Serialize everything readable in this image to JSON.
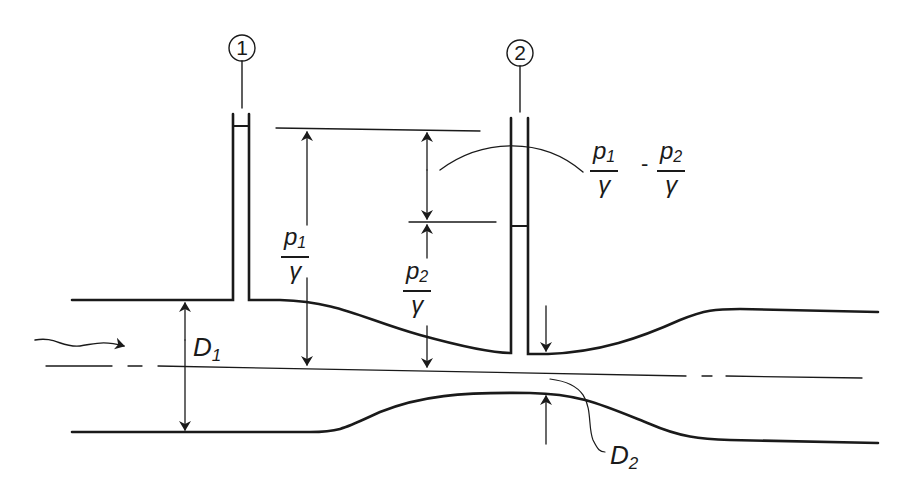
{
  "diagram": {
    "type": "venturi-meter",
    "colors": {
      "line": "#1a1a1a",
      "background": "#ffffff"
    },
    "stations": [
      {
        "label": "1"
      },
      {
        "label": "2"
      }
    ],
    "labels": {
      "p1_head": {
        "num": "p",
        "num_sub": "1",
        "den": "γ"
      },
      "p2_head": {
        "num": "p",
        "num_sub": "2",
        "den": "γ"
      },
      "diff": {
        "a": {
          "num": "p",
          "num_sub": "1",
          "den": "γ"
        },
        "op": "-",
        "b": {
          "num": "p",
          "num_sub": "2",
          "den": "γ"
        }
      },
      "d1": {
        "main": "D",
        "sub": "1"
      },
      "d2": {
        "main": "D",
        "sub": "2"
      }
    },
    "flow_arrow": "flow-direction"
  }
}
